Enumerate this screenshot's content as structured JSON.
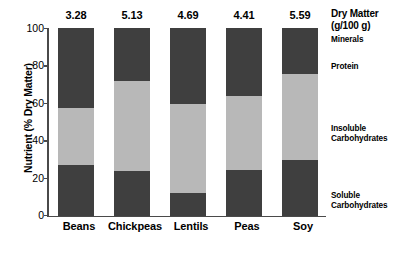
{
  "chart_data": {
    "type": "bar",
    "subtype": "stacked-bar-100",
    "title": "",
    "xlabel": "",
    "ylabel": "Nutrient (% Dry Matter)",
    "ylim": [
      0,
      100
    ],
    "yticks": [
      0,
      20,
      40,
      60,
      80,
      100
    ],
    "grid": false,
    "legend_position": "right",
    "categories": [
      "Beans",
      "Chickpeas",
      "Lentils",
      "Peas",
      "Soy"
    ],
    "series": [
      {
        "name": "Soluble Carbohydrates",
        "color": "#3f3f3f",
        "values": [
          27.0,
          24.0,
          12.5,
          24.5,
          30.0
        ]
      },
      {
        "name": "Insoluble Carbohydrates",
        "color": "#b8b8b8",
        "values": [
          30.5,
          48.0,
          47.0,
          39.5,
          45.5
        ]
      },
      {
        "name": "Protein",
        "color": "#3f3f3f",
        "values": [
          36.5,
          22.0,
          34.5,
          30.5,
          19.0
        ]
      },
      {
        "name": "Minerals",
        "color": "#3f3f3f",
        "values": [
          6.0,
          6.0,
          6.0,
          5.5,
          5.5
        ]
      }
    ],
    "annotations": {
      "label": "Dry Matter (g/100 g)",
      "values": [
        "3.28",
        "5.13",
        "4.69",
        "4.41",
        "5.59"
      ]
    }
  },
  "axis": {
    "y_title": "Nutrient (% Dry Matter)",
    "y_ticks": [
      "100",
      "80",
      "60",
      "40",
      "20",
      "0"
    ]
  },
  "bars": [
    {
      "category": "Beans",
      "dry_matter": "3.28"
    },
    {
      "category": "Chickpeas",
      "dry_matter": "5.13"
    },
    {
      "category": "Lentils",
      "dry_matter": "4.69"
    },
    {
      "category": "Peas",
      "dry_matter": "4.41"
    },
    {
      "category": "Soy",
      "dry_matter": "5.59"
    }
  ],
  "legend": {
    "title_line1": "Dry Matter",
    "title_line2": "(g/100 g)",
    "minerals": "Minerals",
    "protein": "Protein",
    "insoluble_line1": "Insoluble",
    "insoluble_line2": "Carbohydrates",
    "soluble_line1": "Soluble",
    "soluble_line2": "Carbohydrates"
  },
  "colors": {
    "dark": "#3f3f3f",
    "light": "#b8b8b8",
    "axis": "#4a4a4a"
  }
}
